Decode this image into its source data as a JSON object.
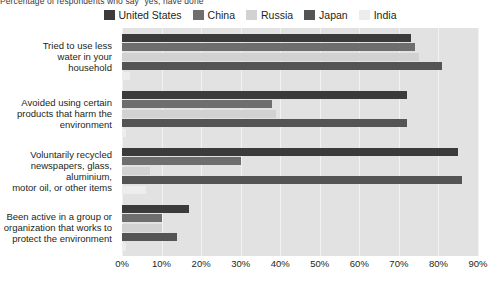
{
  "subtitle": "Percentage of respondents who say \"yes, have done\"",
  "legend": {
    "position": "top-center",
    "items": [
      {
        "label": "United States",
        "color": "#3b3b3b",
        "name": "legend-united-states"
      },
      {
        "label": "China",
        "color": "#6e6e6e",
        "name": "legend-china"
      },
      {
        "label": "Russia",
        "color": "#d2d2d2",
        "name": "legend-russia"
      },
      {
        "label": "Japan",
        "color": "#545454",
        "name": "legend-japan"
      },
      {
        "label": "India",
        "color": "#ededed",
        "name": "legend-india"
      }
    ]
  },
  "axis": {
    "ticks": [
      "0%",
      "10%",
      "20%",
      "30%",
      "40%",
      "50%",
      "60%",
      "70%",
      "80%",
      "90%"
    ],
    "min": 0,
    "max": 90
  },
  "chart_data": {
    "type": "bar",
    "orientation": "horizontal",
    "title": "",
    "subtitle": "Percentage of respondents who say \"yes, have done\"",
    "xlabel": "",
    "ylabel": "",
    "xlim": [
      0,
      90
    ],
    "grid": true,
    "legend_position": "top-center",
    "categories": [
      "Tried to use less water in your household",
      "Avoided using certain products that harm the environment",
      "Voluntarily recycled newspapers, glass, aluminium, motor oil, or other items",
      "Been active in a group or organization that works to protect the environment"
    ],
    "category_lines": [
      [
        "Tried to use less",
        "water in your",
        "household"
      ],
      [
        "Avoided using certain",
        "products that harm the",
        "environment"
      ],
      [
        "Voluntarily recycled",
        "newspapers, glass,",
        "aluminium,",
        "motor oil, or other items"
      ],
      [
        "Been active in a group or",
        "organization that works to",
        "protect the environment"
      ]
    ],
    "series": [
      {
        "name": "United States",
        "color": "#3b3b3b",
        "values": [
          73,
          72,
          85,
          17
        ]
      },
      {
        "name": "China",
        "color": "#6e6e6e",
        "values": [
          74,
          38,
          30,
          10
        ]
      },
      {
        "name": "Russia",
        "color": "#d2d2d2",
        "values": [
          75,
          39,
          7,
          10
        ]
      },
      {
        "name": "Japan",
        "color": "#545454",
        "values": [
          81,
          72,
          86,
          14
        ]
      },
      {
        "name": "India",
        "color": "#ededed",
        "values": [
          2,
          1,
          6,
          1
        ]
      }
    ]
  }
}
